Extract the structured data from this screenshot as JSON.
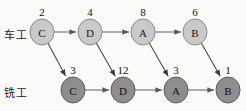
{
  "diagram": {
    "rows": [
      {
        "id": "lathe",
        "label": "车工",
        "node_fill": "#c9c9c9",
        "node_stroke": "#8a8a8a",
        "nodes": [
          {
            "letter": "C",
            "number": "2",
            "cx": 42,
            "cy": 32
          },
          {
            "letter": "D",
            "number": "4",
            "cx": 90,
            "cy": 32
          },
          {
            "letter": "A",
            "number": "8",
            "cx": 143,
            "cy": 32
          },
          {
            "letter": "B",
            "number": "6",
            "cx": 195,
            "cy": 32
          }
        ]
      },
      {
        "id": "mill",
        "label": "铣工",
        "node_fill": "#8e8e8e",
        "node_stroke": "#5d5d5d",
        "nodes": [
          {
            "letter": "C",
            "number": "3",
            "cx": 73,
            "cy": 90
          },
          {
            "letter": "D",
            "number": "12",
            "cx": 123,
            "cy": 90
          },
          {
            "letter": "A",
            "number": "3",
            "cx": 176,
            "cy": 90
          },
          {
            "letter": "B",
            "number": "1",
            "cx": 228,
            "cy": 90
          }
        ]
      }
    ],
    "edges": {
      "horizontal": [
        {
          "from": "lathe-C",
          "to": "lathe-D"
        },
        {
          "from": "lathe-D",
          "to": "lathe-A"
        },
        {
          "from": "lathe-A",
          "to": "lathe-B"
        },
        {
          "from": "mill-C",
          "to": "mill-D"
        },
        {
          "from": "mill-D",
          "to": "mill-A"
        },
        {
          "from": "mill-A",
          "to": "mill-B"
        }
      ],
      "diagonal": [
        {
          "from": "lathe-C",
          "to": "mill-C"
        },
        {
          "from": "lathe-D",
          "to": "mill-D"
        },
        {
          "from": "lathe-A",
          "to": "mill-A"
        },
        {
          "from": "lathe-B",
          "to": "mill-B"
        }
      ]
    },
    "node_rx": 12,
    "node_ry": 13,
    "colors": {
      "edge": "#6f6f6f",
      "edge_diagonal": "#4a4a4a",
      "text": "#1a1a1a",
      "background": "#fbfbfa"
    }
  }
}
